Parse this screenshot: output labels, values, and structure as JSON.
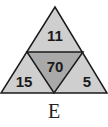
{
  "diagram": {
    "title_label": "E",
    "numbers": {
      "top": "11",
      "center": "70",
      "left": "15",
      "right": "5"
    },
    "colors": {
      "outer": "#cfcfcf",
      "center": "#a9a9a9",
      "stroke": "#1a1a1a"
    }
  }
}
